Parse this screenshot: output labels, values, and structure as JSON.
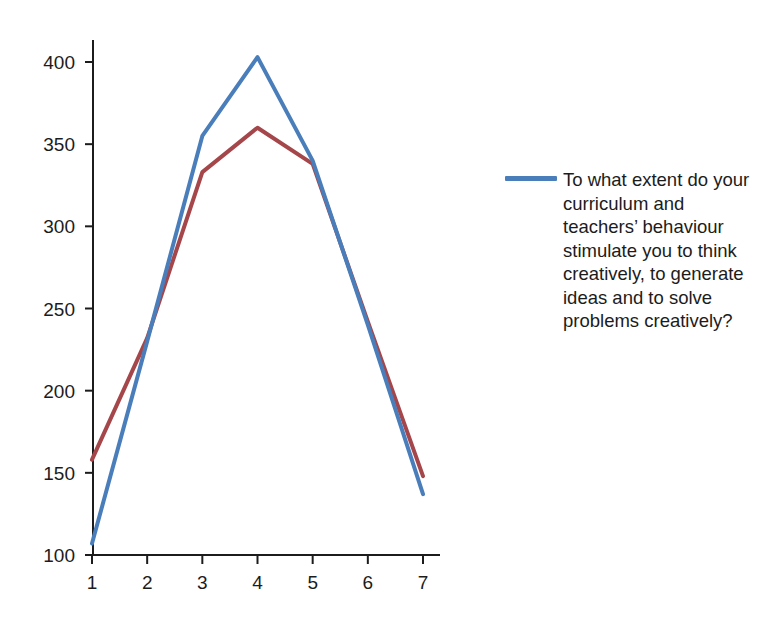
{
  "chart_data": {
    "type": "line",
    "title": "",
    "subtitle": "",
    "xlabel": "",
    "ylabel": "",
    "categories": [
      "1",
      "2",
      "3",
      "4",
      "5",
      "6",
      "7"
    ],
    "x": [
      1,
      2,
      3,
      4,
      5,
      6,
      7
    ],
    "xlim": [
      1,
      7
    ],
    "ylim": [
      100,
      400
    ],
    "xticks": [
      "1",
      "2",
      "3",
      "4",
      "5",
      "6",
      "7"
    ],
    "yticks": [
      "100",
      "150",
      "200",
      "250",
      "300",
      "350",
      "400"
    ],
    "grid": false,
    "legend_position": "right",
    "series": [
      {
        "name": "To what extent do your curriculum and teachers’ behaviour stimulate you to think creatively, to generate ideas and to solve problems creatively?",
        "color": "#4a7ebb",
        "values": [
          107,
          230,
          355,
          403,
          340,
          240,
          137
        ]
      },
      {
        "name": "",
        "color": "#a5474a",
        "values": [
          158,
          232,
          333,
          360,
          338,
          242,
          148
        ]
      }
    ],
    "annotations": []
  },
  "legend": {
    "entries": [
      {
        "label": "To what extent do your curriculum and teachers’ behaviour stimulate you to think creatively, to generate ideas and to solve problems creatively?",
        "color": "#4a7ebb"
      }
    ]
  },
  "colors": {
    "series_1": "#4a7ebb",
    "series_2": "#a5474a",
    "axis": "#1c1c1c",
    "text": "#1c1c1c",
    "background": "#ffffff"
  }
}
